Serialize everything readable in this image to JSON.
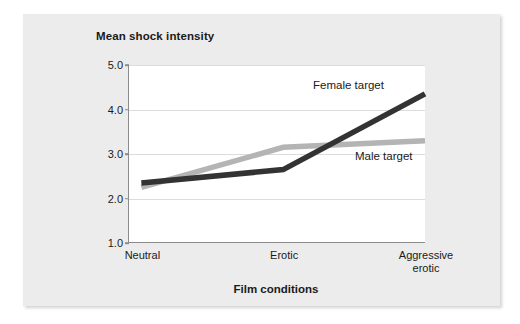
{
  "chart_data": {
    "type": "line",
    "title": "",
    "ylabel": "Mean shock intensity",
    "xlabel": "Film conditions",
    "categories": [
      "Neutral",
      "Erotic",
      "Aggressive\nerotic"
    ],
    "ylim": [
      1.0,
      5.0
    ],
    "yticks": [
      "1.0",
      "2.0",
      "3.0",
      "4.0",
      "5.0"
    ],
    "grid": true,
    "legend_position": "inline-annotations",
    "series": [
      {
        "name": "Female target",
        "color": "#333333",
        "values": [
          2.35,
          2.65,
          4.35
        ]
      },
      {
        "name": "Male target",
        "color": "#b4b4b4",
        "values": [
          2.25,
          3.15,
          3.3
        ]
      }
    ]
  },
  "figure": {
    "background_color": "#ececec",
    "plot_background_color": "#ffffff",
    "axis_color": "#8b8b8b",
    "gridline_color": "#dcdcdc"
  }
}
